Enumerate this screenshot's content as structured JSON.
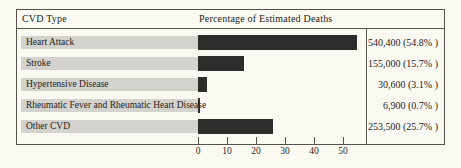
{
  "header": {
    "cvd_type": "CVD Type",
    "percentage_title": "Percentage of Estimated Deaths"
  },
  "chart_data": {
    "type": "bar",
    "orientation": "horizontal",
    "title": "Percentage of Estimated Deaths",
    "xlabel": "",
    "ylabel": "CVD Type",
    "xlim": [
      0,
      57
    ],
    "x_ticks": [
      0,
      10,
      20,
      30,
      40,
      50
    ],
    "grid": false,
    "legend": "none",
    "categories": [
      "Heart Attack",
      "Stroke",
      "Hypertensive Disease",
      "Rheumatic Fever and Rheumatic Heart Disease",
      "Other CVD"
    ],
    "series": [
      {
        "name": "Percentage of Estimated Deaths",
        "values": [
          54.8,
          15.7,
          3.1,
          0.7,
          25.7
        ]
      }
    ],
    "rows": [
      {
        "label": "Heart Attack",
        "percent": 54.8,
        "deaths": 540400,
        "value_label": "540,400 (54.8% )"
      },
      {
        "label": "Stroke",
        "percent": 15.7,
        "deaths": 155000,
        "value_label": "155,000 (15.7% )"
      },
      {
        "label": "Hypertensive Disease",
        "percent": 3.1,
        "deaths": 30600,
        "value_label": "30,600 (3.1% )"
      },
      {
        "label": "Rheumatic Fever and Rheumatic Heart Disease",
        "percent": 0.7,
        "deaths": 6900,
        "value_label": "6,900 (0.7% )"
      },
      {
        "label": "Other CVD",
        "percent": 25.7,
        "deaths": 253500,
        "value_label": "253,500 (25.7% )"
      }
    ]
  },
  "colors": {
    "background": "#fbfaf2",
    "bar": "#2d2c2a",
    "label_strip": "#d3d2cc",
    "border": "#55524c",
    "text": "#26221d"
  }
}
